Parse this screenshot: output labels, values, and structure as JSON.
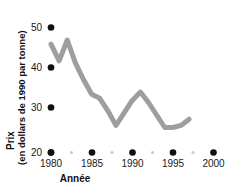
{
  "chart_data": {
    "type": "line",
    "title": "",
    "xlabel": "Année",
    "ylabel": "Prix",
    "ylabel_sub": "(en dollars de 1990 par tonne)",
    "xlim": [
      1978.5,
      2001
    ],
    "ylim": [
      20,
      52
    ],
    "grid": false,
    "legend": "none",
    "line_color": "#9e9e9e",
    "marker_color": "#111111",
    "minor_marker_color": "#c9c9c9",
    "x_ticks": [
      1980,
      1985,
      1990,
      1995,
      2000
    ],
    "x_tick_labels": [
      "1980",
      "1985",
      "1990",
      "1995",
      "2000"
    ],
    "x_minor_ticks": [
      1982.5,
      1987.5,
      1992.5,
      1997.5
    ],
    "y_ticks": [
      20,
      30,
      40,
      50
    ],
    "y_tick_labels": [
      "20",
      "30",
      "40",
      "50"
    ],
    "x": [
      1980,
      1981,
      1982,
      1983,
      1984,
      1985,
      1986,
      1987,
      1988,
      1989,
      1990,
      1991,
      1992,
      1993,
      1994,
      1995,
      1996,
      1997
    ],
    "values": [
      46.0,
      42.0,
      47.0,
      41.5,
      37.5,
      34.0,
      33.0,
      30.0,
      26.5,
      29.5,
      32.5,
      34.5,
      32.0,
      29.0,
      26.0,
      26.0,
      26.5,
      28.0
    ]
  },
  "axis": {
    "ylabel_line1": "Prix",
    "ylabel_line2": "(en dollars de 1990 par tonne)",
    "xlabel": "Année"
  }
}
